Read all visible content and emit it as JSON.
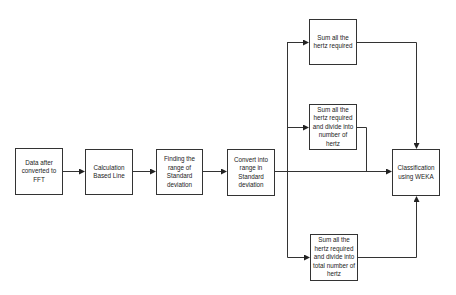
{
  "diagram": {
    "type": "flowchart",
    "colors": {
      "stroke": "#333333",
      "fill": "#ffffff",
      "text": "#222222"
    },
    "nodes": [
      {
        "id": "n1",
        "label": "Data after converted to FFT"
      },
      {
        "id": "n2",
        "label": "Calculation Based Line"
      },
      {
        "id": "n3",
        "label": "Finding the range of Standard deviation"
      },
      {
        "id": "n4",
        "label": "Convert into range in Standard deviation"
      },
      {
        "id": "n5",
        "label": "Sum all the hertz required"
      },
      {
        "id": "n6",
        "label": "Sum all the hertz required and divide into number of hertz"
      },
      {
        "id": "n7",
        "label": "Sum all the hertz required and divide into total number of hertz"
      },
      {
        "id": "n8",
        "label": "Classification using WEKA"
      }
    ],
    "edges": [
      {
        "from": "n1",
        "to": "n2"
      },
      {
        "from": "n2",
        "to": "n3"
      },
      {
        "from": "n3",
        "to": "n4"
      },
      {
        "from": "n4",
        "to": "n5"
      },
      {
        "from": "n4",
        "to": "n6"
      },
      {
        "from": "n4",
        "to": "n7"
      },
      {
        "from": "n4",
        "to": "n8"
      },
      {
        "from": "n5",
        "to": "n8"
      },
      {
        "from": "n6",
        "to": "n8"
      },
      {
        "from": "n7",
        "to": "n8"
      }
    ]
  }
}
